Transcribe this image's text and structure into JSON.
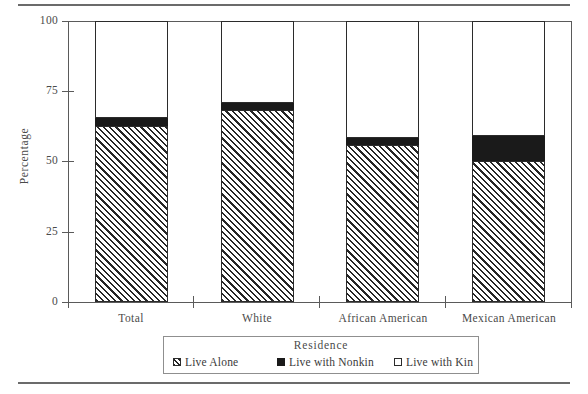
{
  "chart_data": {
    "type": "bar",
    "stacked": true,
    "title": "",
    "xlabel": "Residence",
    "ylabel": "Percentage",
    "ylim": [
      0,
      100
    ],
    "yticks": [
      0,
      25,
      50,
      75,
      100
    ],
    "ytick_labels": [
      "0",
      "25",
      "50",
      "75",
      "100"
    ],
    "grid": false,
    "legend_position": "below-axis",
    "legend_title": "Residence",
    "categories": [
      "Total",
      "White",
      "African American",
      "Mexican American"
    ],
    "series": [
      {
        "name": "Live Alone",
        "swatch": "hatched",
        "values": [
          62.6,
          68.3,
          55.8,
          50.1
        ]
      },
      {
        "name": "Live with Nonkin",
        "swatch": "solid-black",
        "values": [
          2.8,
          2.4,
          2.5,
          8.9
        ]
      },
      {
        "name": "Live with Kin",
        "swatch": "white",
        "values": [
          34.6,
          29.3,
          41.7,
          41.0
        ]
      }
    ]
  },
  "axes": {
    "y_title": "Percentage",
    "y_labels": [
      "100",
      "75",
      "50",
      "25",
      "0"
    ],
    "x_labels": [
      "Total",
      "White",
      "African American",
      "Mexican American"
    ]
  },
  "legend": {
    "title": "Residence",
    "items": [
      {
        "label": "Live Alone",
        "icon": "hatched-square-icon"
      },
      {
        "label": "Live with Nonkin",
        "icon": "filled-square-icon"
      },
      {
        "label": "Live with Kin",
        "icon": "empty-square-icon"
      }
    ]
  },
  "colors": {
    "ink": "#2b2b2b",
    "axis": "#5a5a5a",
    "rule": "#6b6b6b",
    "nonkin_fill": "#1a1a1a",
    "kin_fill": "#ffffff",
    "background": "#ffffff"
  }
}
